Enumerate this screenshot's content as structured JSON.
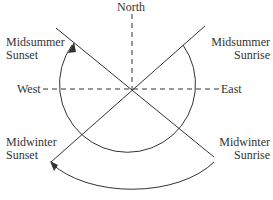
{
  "labels": {
    "north": "North",
    "west": "West",
    "east": "East",
    "midsummer_sunset": [
      "Midsummer",
      "Sunset"
    ],
    "midsummer_sunrise": [
      "Midsummer",
      "Sunrise"
    ],
    "midwinter_sunset": [
      "Midwinter",
      "Sunset"
    ],
    "midwinter_sunrise": [
      "Midwinter",
      "Sunrise"
    ]
  },
  "colors": {
    "line": "#333333",
    "background": "#ffffff"
  }
}
